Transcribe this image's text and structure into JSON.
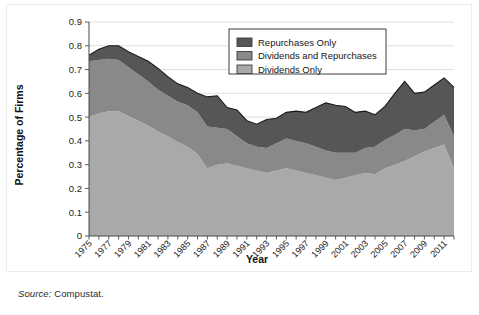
{
  "figure": {
    "source_label": "Source:",
    "source_text": " Compustat."
  },
  "chart_data": {
    "type": "area",
    "stacked": true,
    "title": "",
    "xlabel": "Year",
    "ylabel": "Percentage of Firms",
    "xlim": [
      1975,
      2012
    ],
    "ylim": [
      0,
      0.9
    ],
    "ygrid": true,
    "ytick_labels": [
      "0",
      "0.1",
      "0.2",
      "0.3",
      "0.4",
      "0.5",
      "0.6",
      "0.7",
      "0.8",
      "0.9"
    ],
    "ytick_values": [
      0,
      0.1,
      0.2,
      0.3,
      0.4,
      0.5,
      0.6,
      0.7,
      0.8,
      0.9
    ],
    "xtick_labels": [
      "1975",
      "1977",
      "1979",
      "1981",
      "1983",
      "1985",
      "1987",
      "1989",
      "1991",
      "1993",
      "1995",
      "1997",
      "1999",
      "2001",
      "2003",
      "2005",
      "2007",
      "2009",
      "2011"
    ],
    "xtick_values": [
      1975,
      1977,
      1979,
      1981,
      1983,
      1985,
      1987,
      1989,
      1991,
      1993,
      1995,
      1997,
      1999,
      2001,
      2003,
      2005,
      2007,
      2009,
      2011
    ],
    "legend_position": "top-center",
    "x": [
      1975,
      1976,
      1977,
      1978,
      1979,
      1980,
      1981,
      1982,
      1983,
      1984,
      1985,
      1986,
      1987,
      1988,
      1989,
      1990,
      1991,
      1992,
      1993,
      1994,
      1995,
      1996,
      1997,
      1998,
      1999,
      2000,
      2001,
      2002,
      2003,
      2004,
      2005,
      2006,
      2007,
      2008,
      2009,
      2010,
      2011,
      2012
    ],
    "series": [
      {
        "name": "Dividends Only",
        "color": "#a9a9a9",
        "values": [
          0.5,
          0.515,
          0.525,
          0.525,
          0.505,
          0.485,
          0.465,
          0.44,
          0.42,
          0.395,
          0.375,
          0.345,
          0.285,
          0.3,
          0.305,
          0.295,
          0.285,
          0.275,
          0.265,
          0.275,
          0.285,
          0.275,
          0.265,
          0.255,
          0.245,
          0.235,
          0.245,
          0.255,
          0.265,
          0.26,
          0.285,
          0.3,
          0.315,
          0.335,
          0.355,
          0.37,
          0.385,
          0.285
        ]
      },
      {
        "name": "Dividends and Repurchases",
        "color": "#898989",
        "values": [
          0.235,
          0.225,
          0.22,
          0.215,
          0.205,
          0.195,
          0.185,
          0.175,
          0.17,
          0.17,
          0.175,
          0.175,
          0.175,
          0.155,
          0.145,
          0.125,
          0.105,
          0.1,
          0.105,
          0.115,
          0.125,
          0.125,
          0.125,
          0.12,
          0.115,
          0.115,
          0.105,
          0.095,
          0.105,
          0.115,
          0.12,
          0.125,
          0.135,
          0.11,
          0.095,
          0.11,
          0.125,
          0.135
        ]
      },
      {
        "name": "Repurchases Only",
        "color": "#565656",
        "values": [
          0.025,
          0.045,
          0.055,
          0.06,
          0.065,
          0.075,
          0.085,
          0.09,
          0.08,
          0.075,
          0.075,
          0.08,
          0.125,
          0.135,
          0.09,
          0.11,
          0.095,
          0.095,
          0.12,
          0.105,
          0.11,
          0.125,
          0.13,
          0.165,
          0.2,
          0.2,
          0.195,
          0.17,
          0.155,
          0.135,
          0.14,
          0.175,
          0.2,
          0.155,
          0.155,
          0.155,
          0.155,
          0.205
        ]
      }
    ],
    "legend_entries": [
      {
        "label": "Repurchases Only",
        "color": "#565656"
      },
      {
        "label": "Dividends and Repurchases",
        "color": "#898989"
      },
      {
        "label": "Dividends Only",
        "color": "#a9a9a9"
      }
    ]
  }
}
